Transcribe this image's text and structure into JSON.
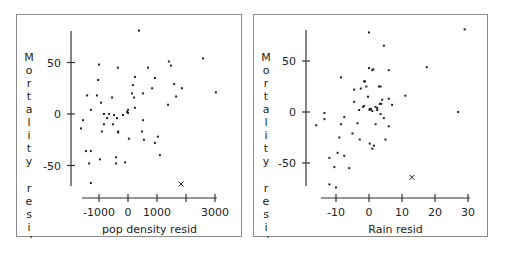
{
  "chart_data": [
    {
      "type": "scatter",
      "title": "",
      "xlabel": "pop density resid",
      "ylabel": "Mortality resid",
      "xticks": [
        -1000,
        0,
        1000,
        2000,
        3000
      ],
      "xtick_labels": [
        "-1000",
        "0",
        "1000",
        "",
        "3000"
      ],
      "yticks": [
        50,
        0,
        -50
      ],
      "ytick_labels": [
        "50",
        "0",
        "-50"
      ],
      "xlim": [
        -1700,
        3100
      ],
      "ylim": [
        -75,
        85
      ],
      "grid": false,
      "points": [
        [
          380,
          81
        ],
        [
          2590,
          54
        ],
        [
          1410,
          51
        ],
        [
          1480,
          47
        ],
        [
          -1000,
          48
        ],
        [
          -350,
          45
        ],
        [
          690,
          45
        ],
        [
          -1030,
          33
        ],
        [
          240,
          36
        ],
        [
          930,
          35
        ],
        [
          1590,
          29
        ],
        [
          1860,
          25
        ],
        [
          830,
          25
        ],
        [
          170,
          28
        ],
        [
          3030,
          21
        ],
        [
          520,
          20
        ],
        [
          140,
          20
        ],
        [
          -1410,
          18
        ],
        [
          -1070,
          18
        ],
        [
          -550,
          16
        ],
        [
          210,
          16
        ],
        [
          1660,
          17
        ],
        [
          -930,
          11
        ],
        [
          1380,
          9
        ],
        [
          240,
          6
        ],
        [
          -1280,
          4
        ],
        [
          0,
          4
        ],
        [
          -30,
          2
        ],
        [
          0,
          1
        ],
        [
          -830,
          0
        ],
        [
          -650,
          0
        ],
        [
          -480,
          -1
        ],
        [
          -170,
          -1
        ],
        [
          -720,
          -4
        ],
        [
          -380,
          -4
        ],
        [
          -1550,
          -6
        ],
        [
          520,
          -6
        ],
        [
          -830,
          -10
        ],
        [
          -520,
          -10
        ],
        [
          -1620,
          -14
        ],
        [
          -900,
          -17
        ],
        [
          -340,
          -17
        ],
        [
          -340,
          -18
        ],
        [
          480,
          -17
        ],
        [
          1030,
          -22
        ],
        [
          30,
          -24
        ],
        [
          550,
          -25
        ],
        [
          930,
          -28
        ],
        [
          -1450,
          -36
        ],
        [
          -1280,
          -36
        ],
        [
          1100,
          -40
        ],
        [
          -410,
          -42
        ],
        [
          -970,
          -44
        ],
        [
          -1340,
          -48
        ],
        [
          -410,
          -48
        ],
        [
          -100,
          -47
        ],
        [
          -1280,
          -67
        ]
      ],
      "outliers": [
        [
          1830,
          -68
        ]
      ],
      "outlier_marker": "x"
    },
    {
      "type": "scatter",
      "title": "",
      "xlabel": "Rain resid",
      "ylabel": "Mortality resid",
      "xticks": [
        -10,
        0,
        10,
        20,
        30
      ],
      "xtick_labels": [
        "-10",
        "0",
        "10",
        "20",
        "30"
      ],
      "yticks": [
        50,
        0,
        -50
      ],
      "ytick_labels": [
        "50",
        "0",
        "-50"
      ],
      "xlim": [
        -17,
        31
      ],
      "ylim": [
        -75,
        85
      ],
      "grid": false,
      "points": [
        [
          0,
          78
        ],
        [
          29,
          81
        ],
        [
          4.5,
          65
        ],
        [
          17.5,
          44
        ],
        [
          0,
          43
        ],
        [
          1,
          41
        ],
        [
          1.3,
          42
        ],
        [
          6,
          41
        ],
        [
          -8.5,
          34
        ],
        [
          -1.5,
          30
        ],
        [
          -1.2,
          30
        ],
        [
          -0.8,
          25
        ],
        [
          3,
          25
        ],
        [
          3.5,
          25
        ],
        [
          -4.5,
          22
        ],
        [
          -2.5,
          23
        ],
        [
          11,
          16
        ],
        [
          -0.3,
          15
        ],
        [
          4,
          12
        ],
        [
          6,
          13
        ],
        [
          -4.5,
          10
        ],
        [
          3.3,
          8
        ],
        [
          3.7,
          8
        ],
        [
          7,
          7
        ],
        [
          -1.8,
          5
        ],
        [
          -1.5,
          6
        ],
        [
          2,
          5
        ],
        [
          2.5,
          4
        ],
        [
          0.2,
          3
        ],
        [
          0.6,
          3
        ],
        [
          0.2,
          2
        ],
        [
          -3,
          2
        ],
        [
          1,
          1
        ],
        [
          2.5,
          2
        ],
        [
          -13.5,
          -1
        ],
        [
          27,
          0
        ],
        [
          3.5,
          -2
        ],
        [
          -13.5,
          -7
        ],
        [
          -7.5,
          -5
        ],
        [
          4.5,
          -6
        ],
        [
          -3.5,
          -11
        ],
        [
          -8.5,
          -12
        ],
        [
          2,
          -12
        ],
        [
          -16,
          -13
        ],
        [
          6,
          -14
        ],
        [
          -5,
          -21
        ],
        [
          -9,
          -25
        ],
        [
          -2.8,
          -27
        ],
        [
          5,
          -27
        ],
        [
          0.2,
          -31
        ],
        [
          1.5,
          -33
        ],
        [
          1,
          -36
        ],
        [
          -9.5,
          -40
        ],
        [
          -12,
          -45
        ],
        [
          -7.5,
          -43
        ],
        [
          -10.5,
          -54
        ],
        [
          -6,
          -55
        ],
        [
          -12,
          -71
        ],
        [
          -10,
          -74
        ]
      ],
      "outliers": [
        [
          13,
          -64
        ]
      ],
      "outlier_marker": "x"
    }
  ]
}
